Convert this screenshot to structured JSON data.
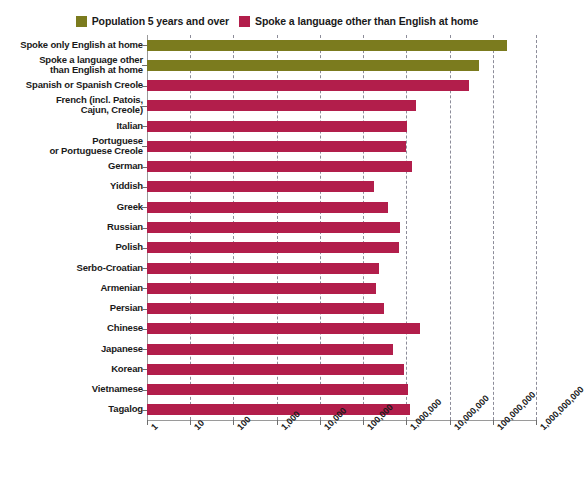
{
  "top_crumb": "",
  "legend": {
    "position": "top-center",
    "items": [
      {
        "label": "Population 5 years and over",
        "color": "#7b7b1e",
        "icon": "legend-swatch"
      },
      {
        "label": "Spoke a language other than English at home",
        "color": "#b21e4b",
        "icon": "legend-swatch"
      }
    ]
  },
  "chart_data": {
    "type": "bar",
    "orientation": "horizontal",
    "title": "",
    "subtitle": "",
    "xlabel": "",
    "ylabel": "",
    "xscale": "log",
    "xlim": [
      1,
      1000000000
    ],
    "grid": true,
    "legend_position": "top-center",
    "xticks": [
      1,
      10,
      100,
      1000,
      10000,
      100000,
      1000000,
      10000000,
      100000000,
      1000000000
    ],
    "xticklabels": [
      "1",
      "10",
      "100",
      "1,000",
      "10,000",
      "100,000",
      "1,000,000",
      "10,000,000",
      "100,000,000",
      "1,000,000,000"
    ],
    "categories": [
      "Spoke only English at home",
      "Spoke a language other than English at home",
      "Spanish or Spanish Creole",
      "French (incl. Patois, Cajun, Creole)",
      "Italian",
      "Portuguese or Portuguese Creole",
      "German",
      "Yiddish",
      "Greek",
      "Russian",
      "Polish",
      "Serbo-Croatian",
      "Armenian",
      "Persian",
      "Chinese",
      "Japanese",
      "Korean",
      "Vietnamese",
      "Tagalog"
    ],
    "category_lines": [
      [
        "Spoke only English at home"
      ],
      [
        "Spoke a language other",
        "than English at home"
      ],
      [
        "Spanish or Spanish Creole"
      ],
      [
        "French (incl. Patois,",
        "Cajun, Creole)"
      ],
      [
        "Italian"
      ],
      [
        "Portuguese",
        "or Portuguese Creole"
      ],
      [
        "German"
      ],
      [
        "Yiddish"
      ],
      [
        "Greek"
      ],
      [
        "Russian"
      ],
      [
        "Polish"
      ],
      [
        "Serbo-Croatian"
      ],
      [
        "Armenian"
      ],
      [
        "Persian"
      ],
      [
        "Chinese"
      ],
      [
        "Japanese"
      ],
      [
        "Korean"
      ],
      [
        "Vietnamese"
      ],
      [
        "Tagalog"
      ]
    ],
    "values": [
      215400000,
      47000000,
      28100000,
      1640000,
      1010000,
      1000000,
      1380000,
      180000,
      370000,
      710000,
      670000,
      230000,
      200000,
      310000,
      2020000,
      480000,
      890000,
      1120000,
      1220000
    ],
    "series_of_bar": [
      "Population 5 years and over",
      "Population 5 years and over",
      "Spoke a language other than English at home",
      "Spoke a language other than English at home",
      "Spoke a language other than English at home",
      "Spoke a language other than English at home",
      "Spoke a language other than English at home",
      "Spoke a language other than English at home",
      "Spoke a language other than English at home",
      "Spoke a language other than English at home",
      "Spoke a language other than English at home",
      "Spoke a language other than English at home",
      "Spoke a language other than English at home",
      "Spoke a language other than English at home",
      "Spoke a language other than English at home",
      "Spoke a language other than English at home",
      "Spoke a language other than English at home",
      "Spoke a language other than English at home",
      "Spoke a language other than English at home"
    ],
    "colors": {
      "population": "#7b7b1e",
      "other_language": "#b21e4b",
      "gridline": "#8c8c99",
      "axis": "#9a9a9a",
      "text": "#1a1a1a",
      "background": "#ffffff"
    }
  }
}
